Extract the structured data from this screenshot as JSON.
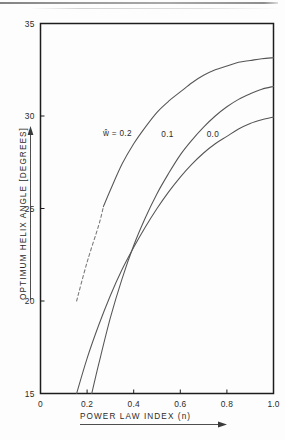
{
  "chart_data": {
    "type": "line",
    "title": "",
    "xlabel": "POWER LAW INDEX (n)",
    "ylabel": "OPTIMUM HELIX ANGLE  [DEGREES]",
    "xlim": [
      0,
      1.0
    ],
    "ylim": [
      15,
      35
    ],
    "xticks": [
      "0",
      "0.2",
      "0.4",
      "0.6",
      "0.8",
      "1.0"
    ],
    "xtick_values": [
      0,
      0.2,
      0.4,
      0.6,
      0.8,
      1.0
    ],
    "yticks": [
      "15",
      "20",
      "25",
      "30",
      "35"
    ],
    "ytick_values": [
      15,
      20,
      25,
      30,
      35
    ],
    "grid": false,
    "legend_position": "inline-curve-labels",
    "series": [
      {
        "name": "w-hat = 0.2",
        "label": "ŵ = 0.2",
        "label_x": 0.33,
        "label_y": 28.9,
        "style": "solid-with-dashed-extrapolation",
        "x": [
          0.155,
          0.2,
          0.25,
          0.27,
          0.3,
          0.35,
          0.4,
          0.45,
          0.5,
          0.55,
          0.6,
          0.65,
          0.7,
          0.75,
          0.8,
          0.85,
          0.9,
          0.95,
          1.0
        ],
        "y": [
          20.0,
          22.1,
          24.1,
          25.1,
          26.0,
          27.4,
          28.5,
          29.4,
          30.2,
          30.8,
          31.3,
          31.8,
          32.2,
          32.5,
          32.7,
          32.9,
          33.0,
          33.1,
          33.15
        ],
        "dashed_x_range": [
          0.155,
          0.27
        ],
        "dashed_y_range": [
          20.0,
          25.1
        ]
      },
      {
        "name": "w-hat = 0.1",
        "label": "0.1",
        "label_x": 0.545,
        "label_y": 28.85,
        "style": "solid",
        "x": [
          0.22,
          0.25,
          0.3,
          0.35,
          0.4,
          0.45,
          0.5,
          0.55,
          0.6,
          0.65,
          0.7,
          0.75,
          0.8,
          0.85,
          0.9,
          0.95,
          1.0
        ],
        "y": [
          15.0,
          16.6,
          19.1,
          21.2,
          23.0,
          24.5,
          25.8,
          26.9,
          27.9,
          28.7,
          29.4,
          30.0,
          30.5,
          30.9,
          31.2,
          31.45,
          31.6
        ],
        "dashed_x_range": null,
        "dashed_y_range": null
      },
      {
        "name": "w-hat = 0.0",
        "label": "0.0",
        "label_x": 0.74,
        "label_y": 28.85,
        "style": "solid",
        "x": [
          0.155,
          0.2,
          0.25,
          0.3,
          0.35,
          0.4,
          0.45,
          0.5,
          0.55,
          0.6,
          0.65,
          0.7,
          0.75,
          0.8,
          0.85,
          0.9,
          0.95,
          1.0
        ],
        "y": [
          15.0,
          16.9,
          18.7,
          20.3,
          21.7,
          22.9,
          24.0,
          25.0,
          25.9,
          26.7,
          27.4,
          28.0,
          28.5,
          28.9,
          29.3,
          29.6,
          29.8,
          29.95
        ],
        "dashed_x_range": null,
        "dashed_y_range": null
      }
    ]
  },
  "axis_arrows": {
    "x_arrow": "right-arrow-marker",
    "y_arrow": "up-arrow-marker"
  },
  "colors": {
    "frame": "#1d1d1d",
    "curve": "#555555",
    "curve_dashed": "#777777",
    "text": "#2b2b2b",
    "background": "#fdfdfd"
  }
}
